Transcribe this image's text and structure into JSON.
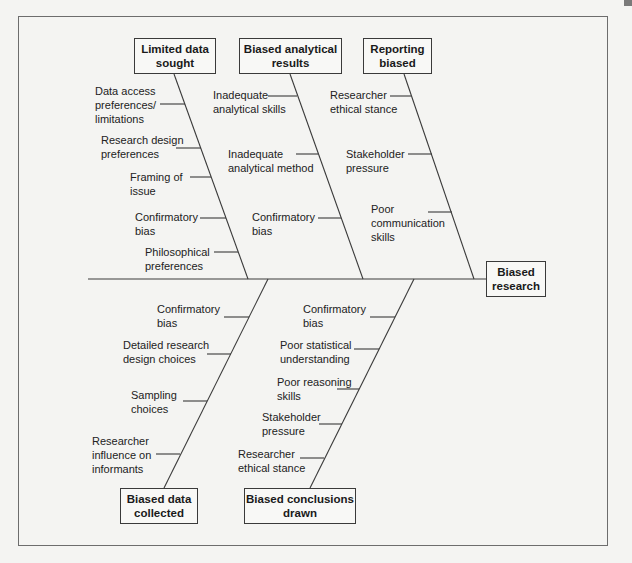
{
  "diagram": {
    "type": "fishbone",
    "effect": {
      "label": "Biased\nresearch"
    },
    "top_categories": [
      {
        "label": "Limited data\nsought",
        "causes": [
          "Data access\npreferences/\nlimitations",
          "Research design\npreferences",
          "Framing of\nissue",
          "Confirmatory\nbias",
          "Philosophical\npreferences"
        ]
      },
      {
        "label": "Biased analytical\nresults",
        "causes": [
          "Inadequate\nanalytical skills",
          "Inadequate\nanalytical method",
          "Confirmatory\nbias"
        ]
      },
      {
        "label": "Reporting\nbiased",
        "causes": [
          "Researcher\nethical stance",
          "Stakeholder\npressure",
          "Poor\ncommunication\nskills"
        ]
      }
    ],
    "bottom_categories": [
      {
        "label": "Biased data\ncollected",
        "causes": [
          "Confirmatory\nbias",
          "Detailed research\ndesign choices",
          "Sampling\nchoices",
          "Researcher\ninfluence on\ninformants"
        ]
      },
      {
        "label": "Biased conclusions\ndrawn",
        "causes": [
          "Confirmatory\nbias",
          "Poor statistical\nunderstanding",
          "Poor reasoning\nskills",
          "Stakeholder\npressure",
          "Researcher\nethical stance"
        ]
      }
    ]
  },
  "colors": {
    "line": "#3a3a3a",
    "frame": "#6d6d6d",
    "background": "#f4f4f2"
  }
}
